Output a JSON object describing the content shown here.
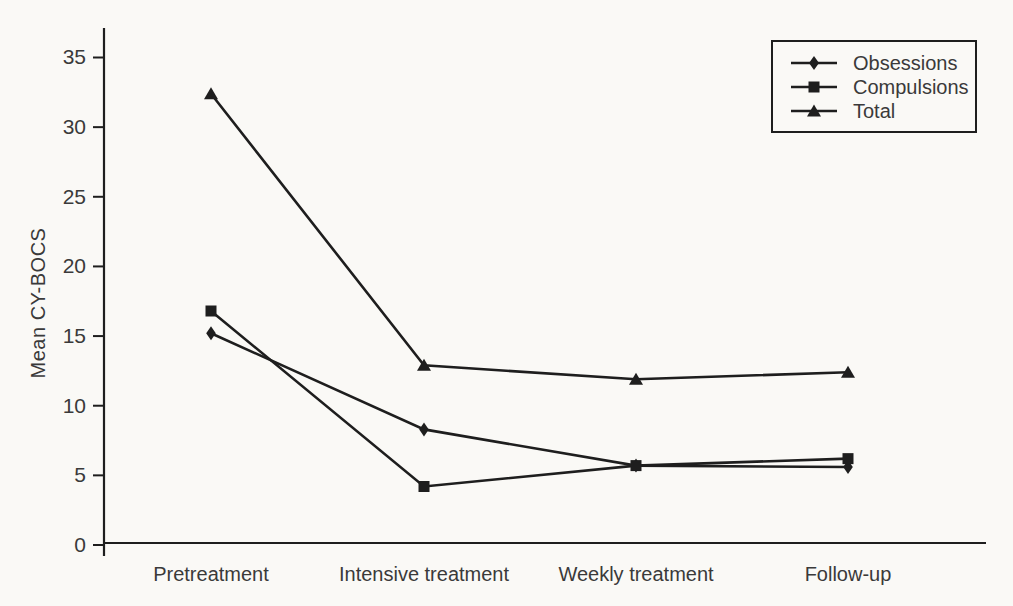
{
  "figure": {
    "background_color": "#faf9f6",
    "line_color": "#1e1e1e",
    "text_color": "#3a3a3a"
  },
  "chart_data": {
    "type": "line",
    "title": "",
    "xlabel": "",
    "ylabel": "Mean CY-BOCS",
    "categories": [
      "Pretreatment",
      "Intensive treatment",
      "Weekly treatment",
      "Follow-up"
    ],
    "series": [
      {
        "name": "Obsessions",
        "marker": "diamond",
        "color": "#1e1e1e",
        "values": [
          15.2,
          8.3,
          5.7,
          5.6
        ]
      },
      {
        "name": "Compulsions",
        "marker": "square",
        "color": "#1e1e1e",
        "values": [
          16.8,
          4.2,
          5.7,
          6.2
        ]
      },
      {
        "name": "Total",
        "marker": "triangle",
        "color": "#1e1e1e",
        "values": [
          32.4,
          12.9,
          11.9,
          12.4
        ]
      }
    ],
    "y_ticks": [
      0,
      5,
      10,
      15,
      20,
      25,
      30,
      35
    ],
    "ylim": [
      0,
      37
    ],
    "grid": false,
    "legend_position": "top-right",
    "legend_entries": [
      "Obsessions",
      "Compulsions",
      "Total"
    ]
  }
}
